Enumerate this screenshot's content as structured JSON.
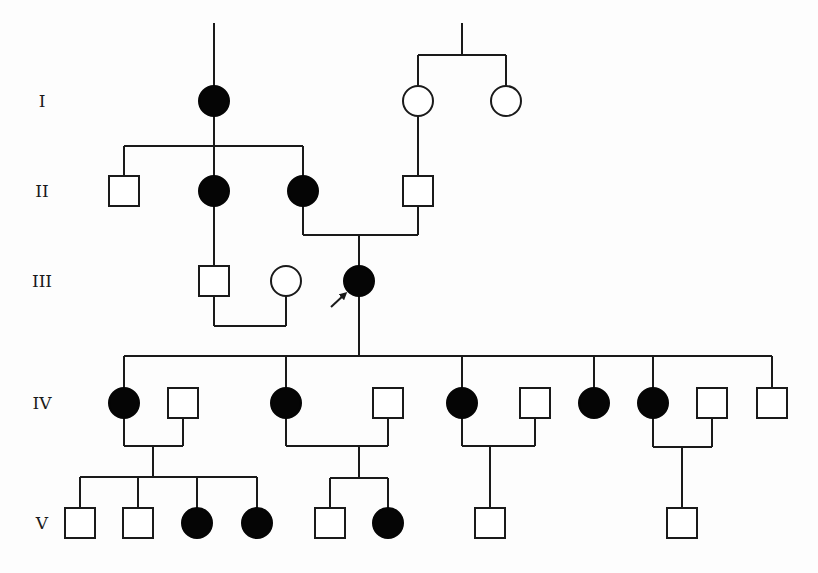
{
  "diagram": {
    "type": "pedigree",
    "colors": {
      "line": "#1a1a1a",
      "affected": "#050505",
      "unaffected": "#ffffff",
      "background": "#fdfdfd"
    },
    "generations": [
      {
        "label": "I",
        "y": 101
      },
      {
        "label": "II",
        "y": 191
      },
      {
        "label": "III",
        "y": 281
      },
      {
        "label": "IV",
        "y": 403
      },
      {
        "label": "V",
        "y": 523
      }
    ],
    "individuals": [
      {
        "id": "I-1",
        "gen": "I",
        "sex": "female",
        "affected": true,
        "x": 214,
        "y": 101
      },
      {
        "id": "I-2",
        "gen": "I",
        "sex": "female",
        "affected": false,
        "x": 418,
        "y": 101
      },
      {
        "id": "I-3",
        "gen": "I",
        "sex": "female",
        "affected": false,
        "x": 506,
        "y": 101
      },
      {
        "id": "II-1",
        "gen": "II",
        "sex": "male",
        "affected": false,
        "x": 124,
        "y": 191
      },
      {
        "id": "II-2",
        "gen": "II",
        "sex": "female",
        "affected": true,
        "x": 214,
        "y": 191
      },
      {
        "id": "II-3",
        "gen": "II",
        "sex": "female",
        "affected": true,
        "x": 303,
        "y": 191
      },
      {
        "id": "II-4",
        "gen": "II",
        "sex": "male",
        "affected": false,
        "x": 418,
        "y": 191
      },
      {
        "id": "III-1",
        "gen": "III",
        "sex": "male",
        "affected": false,
        "x": 214,
        "y": 281
      },
      {
        "id": "III-2",
        "gen": "III",
        "sex": "female",
        "affected": false,
        "x": 286,
        "y": 281
      },
      {
        "id": "III-3",
        "gen": "III",
        "sex": "female",
        "affected": true,
        "x": 359,
        "y": 281,
        "proband": true
      },
      {
        "id": "IV-1",
        "gen": "IV",
        "sex": "female",
        "affected": true,
        "x": 124,
        "y": 403
      },
      {
        "id": "IV-2",
        "gen": "IV",
        "sex": "male",
        "affected": false,
        "x": 183,
        "y": 403
      },
      {
        "id": "IV-3",
        "gen": "IV",
        "sex": "female",
        "affected": true,
        "x": 286,
        "y": 403
      },
      {
        "id": "IV-4",
        "gen": "IV",
        "sex": "male",
        "affected": false,
        "x": 388,
        "y": 403
      },
      {
        "id": "IV-5",
        "gen": "IV",
        "sex": "female",
        "affected": true,
        "x": 462,
        "y": 403
      },
      {
        "id": "IV-6",
        "gen": "IV",
        "sex": "male",
        "affected": false,
        "x": 535,
        "y": 403
      },
      {
        "id": "IV-7",
        "gen": "IV",
        "sex": "female",
        "affected": true,
        "x": 594,
        "y": 403
      },
      {
        "id": "IV-8",
        "gen": "IV",
        "sex": "female",
        "affected": true,
        "x": 653,
        "y": 403
      },
      {
        "id": "IV-9",
        "gen": "IV",
        "sex": "male",
        "affected": false,
        "x": 712,
        "y": 403
      },
      {
        "id": "IV-10",
        "gen": "IV",
        "sex": "male",
        "affected": false,
        "x": 772,
        "y": 403
      },
      {
        "id": "V-1",
        "gen": "V",
        "sex": "male",
        "affected": false,
        "x": 80,
        "y": 523
      },
      {
        "id": "V-2",
        "gen": "V",
        "sex": "male",
        "affected": false,
        "x": 138,
        "y": 523
      },
      {
        "id": "V-3",
        "gen": "V",
        "sex": "female",
        "affected": true,
        "x": 197,
        "y": 523
      },
      {
        "id": "V-4",
        "gen": "V",
        "sex": "female",
        "affected": true,
        "x": 257,
        "y": 523
      },
      {
        "id": "V-5",
        "gen": "V",
        "sex": "male",
        "affected": false,
        "x": 330,
        "y": 523
      },
      {
        "id": "V-6",
        "gen": "V",
        "sex": "female",
        "affected": true,
        "x": 388,
        "y": 523
      },
      {
        "id": "V-7",
        "gen": "V",
        "sex": "male",
        "affected": false,
        "x": 490,
        "y": 523
      },
      {
        "id": "V-8",
        "gen": "V",
        "sex": "male",
        "affected": false,
        "x": 682,
        "y": 523
      }
    ],
    "lines": [
      [
        214,
        23,
        214,
        86
      ],
      [
        214,
        116,
        214,
        146
      ],
      [
        124,
        146,
        303,
        146
      ],
      [
        124,
        146,
        124,
        175
      ],
      [
        214,
        146,
        214,
        176
      ],
      [
        303,
        146,
        303,
        176
      ],
      [
        462,
        23,
        462,
        55
      ],
      [
        418,
        55,
        506,
        55
      ],
      [
        418,
        55,
        418,
        86
      ],
      [
        506,
        55,
        506,
        86
      ],
      [
        418,
        116,
        418,
        175
      ],
      [
        303,
        206,
        303,
        235
      ],
      [
        418,
        206,
        418,
        235
      ],
      [
        303,
        235,
        418,
        235
      ],
      [
        359,
        235,
        359,
        266
      ],
      [
        214,
        206,
        214,
        266
      ],
      [
        214,
        296,
        214,
        326
      ],
      [
        286,
        296,
        286,
        326
      ],
      [
        214,
        326,
        286,
        326
      ],
      [
        359,
        296,
        359,
        356
      ],
      [
        124,
        356,
        772,
        356
      ],
      [
        124,
        356,
        124,
        388
      ],
      [
        286,
        356,
        286,
        388
      ],
      [
        462,
        356,
        462,
        388
      ],
      [
        594,
        356,
        594,
        388
      ],
      [
        653,
        356,
        653,
        388
      ],
      [
        772,
        356,
        772,
        388
      ],
      [
        124,
        418,
        124,
        446
      ],
      [
        183,
        418,
        183,
        446
      ],
      [
        124,
        446,
        183,
        446
      ],
      [
        153,
        446,
        153,
        477
      ],
      [
        80,
        477,
        257,
        477
      ],
      [
        80,
        477,
        80,
        508
      ],
      [
        138,
        477,
        138,
        508
      ],
      [
        197,
        477,
        197,
        508
      ],
      [
        257,
        477,
        257,
        508
      ],
      [
        286,
        418,
        286,
        446
      ],
      [
        388,
        418,
        388,
        446
      ],
      [
        286,
        446,
        388,
        446
      ],
      [
        359,
        446,
        359,
        478
      ],
      [
        330,
        478,
        388,
        478
      ],
      [
        330,
        478,
        330,
        508
      ],
      [
        388,
        478,
        388,
        508
      ],
      [
        462,
        418,
        462,
        446
      ],
      [
        535,
        418,
        535,
        446
      ],
      [
        462,
        446,
        535,
        446
      ],
      [
        490,
        446,
        490,
        508
      ],
      [
        653,
        418,
        653,
        447
      ],
      [
        712,
        418,
        712,
        447
      ],
      [
        653,
        447,
        712,
        447
      ],
      [
        682,
        447,
        682,
        508
      ]
    ],
    "proband_arrow": {
      "x1": 331,
      "y1": 307,
      "x2": 345,
      "y2": 294
    },
    "label_x": 42,
    "symbol_size": 30
  }
}
